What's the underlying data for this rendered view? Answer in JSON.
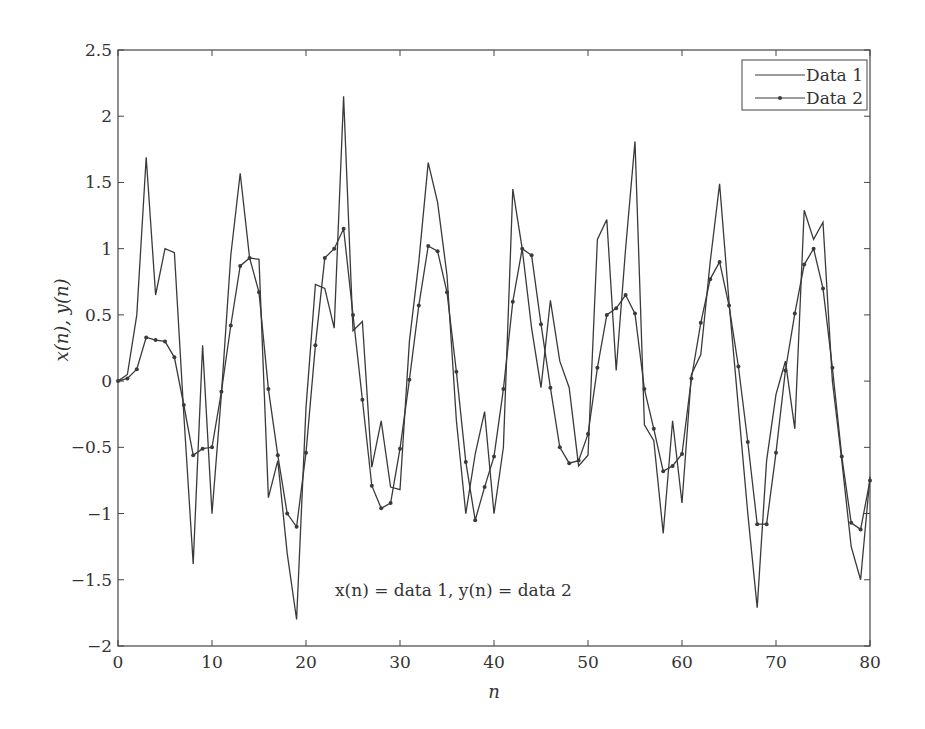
{
  "chart_data": {
    "type": "line",
    "title": "",
    "xlabel": "n",
    "ylabel": "x(n), y(n)",
    "xlim": [
      0,
      80
    ],
    "ylim": [
      -2,
      2.5
    ],
    "xticks": [
      0,
      10,
      20,
      30,
      40,
      50,
      60,
      70,
      80
    ],
    "yticks": [
      -2,
      -1.5,
      -1,
      -0.5,
      0,
      0.5,
      1,
      1.5,
      2,
      2.5
    ],
    "xtick_labels": [
      "0",
      "10",
      "20",
      "30",
      "40",
      "50",
      "60",
      "70",
      "80"
    ],
    "ytick_labels": [
      "−2",
      "−1.5",
      "−1",
      "−0.5",
      "0",
      "0.5",
      "1",
      "1.5",
      "2",
      "2.5"
    ],
    "grid": false,
    "legend_position": "upper right",
    "annotation": "x(n) = data 1, y(n) = data 2",
    "x": [
      0,
      1,
      2,
      3,
      4,
      5,
      6,
      7,
      8,
      9,
      10,
      11,
      12,
      13,
      14,
      15,
      16,
      17,
      18,
      19,
      20,
      21,
      22,
      23,
      24,
      25,
      26,
      27,
      28,
      29,
      30,
      31,
      32,
      33,
      34,
      35,
      36,
      37,
      38,
      39,
      40,
      41,
      42,
      43,
      44,
      45,
      46,
      47,
      48,
      49,
      50,
      51,
      52,
      53,
      54,
      55,
      56,
      57,
      58,
      59,
      60,
      61,
      62,
      63,
      64,
      65,
      66,
      67,
      68,
      69,
      70,
      71,
      72,
      73,
      74,
      75,
      76,
      77,
      78,
      79,
      80
    ],
    "series": [
      {
        "name": "Data 1",
        "marker": "none",
        "values": [
          0,
          0.05,
          0.5,
          1.69,
          0.65,
          1.0,
          0.97,
          -0.25,
          -1.38,
          0.27,
          -1.0,
          -0.1,
          0.95,
          1.57,
          0.93,
          0.92,
          -0.88,
          -0.6,
          -1.3,
          -1.8,
          -0.2,
          0.73,
          0.7,
          0.4,
          2.15,
          0.38,
          0.45,
          -0.65,
          -0.3,
          -0.8,
          -0.82,
          0.3,
          0.9,
          1.65,
          1.35,
          0.8,
          -0.3,
          -1.0,
          -0.55,
          -0.23,
          -1.0,
          -0.5,
          1.45,
          1.0,
          0.4,
          -0.05,
          0.61,
          0.15,
          -0.05,
          -0.64,
          -0.56,
          1.07,
          1.22,
          0.08,
          1.0,
          1.81,
          -0.33,
          -0.45,
          -1.15,
          -0.3,
          -0.92,
          0.05,
          0.2,
          0.9,
          1.49,
          0.6,
          -0.2,
          -1.0,
          -1.71,
          -0.6,
          -0.1,
          0.15,
          -0.36,
          1.29,
          1.07,
          1.2,
          0.0,
          -0.6,
          -1.25,
          -1.5,
          -0.72
        ]
      },
      {
        "name": "Data 2",
        "marker": "dot",
        "values": [
          0,
          0.02,
          0.09,
          0.33,
          0.31,
          0.3,
          0.18,
          -0.18,
          -0.56,
          -0.51,
          -0.5,
          -0.08,
          0.42,
          0.87,
          0.93,
          0.67,
          -0.06,
          -0.56,
          -1.0,
          -1.1,
          -0.54,
          0.27,
          0.93,
          1.0,
          1.15,
          0.5,
          -0.14,
          -0.79,
          -0.96,
          -0.92,
          -0.51,
          0.01,
          0.57,
          1.02,
          0.98,
          0.67,
          0.07,
          -0.61,
          -1.05,
          -0.8,
          -0.57,
          -0.06,
          0.6,
          1.0,
          0.95,
          0.43,
          -0.05,
          -0.5,
          -0.62,
          -0.6,
          -0.4,
          0.1,
          0.5,
          0.55,
          0.65,
          0.51,
          -0.06,
          -0.36,
          -0.68,
          -0.64,
          -0.55,
          0.02,
          0.44,
          0.77,
          0.9,
          0.57,
          0.11,
          -0.46,
          -1.08,
          -1.08,
          -0.54,
          0.08,
          0.51,
          0.88,
          1.0,
          0.7,
          0.1,
          -0.57,
          -1.07,
          -1.12,
          -0.75
        ]
      }
    ]
  },
  "legend": {
    "items": [
      "Data 1",
      "Data 2"
    ]
  },
  "colors": {
    "line": "#3a3a3a",
    "axis": "#444444",
    "background": "#ffffff"
  }
}
